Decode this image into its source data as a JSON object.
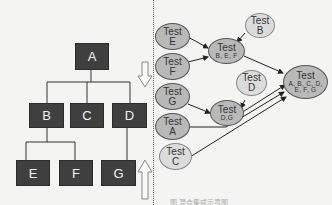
{
  "left_tree": {
    "root": "A",
    "level2": [
      "B",
      "C",
      "D"
    ],
    "level3": [
      "E",
      "F",
      "G"
    ],
    "arrows": {
      "top": "down-arrow",
      "bottom": "up-arrow"
    },
    "box_color": "#3f3f3f"
  },
  "right_graph": {
    "nodes": {
      "e": {
        "line1": "Test",
        "line2": "E"
      },
      "f": {
        "line1": "Test",
        "line2": "F"
      },
      "g": {
        "line1": "Test",
        "line2": "G"
      },
      "a": {
        "line1": "Test",
        "line2": "A"
      },
      "c": {
        "line1": "Test",
        "line2": "C"
      },
      "bef": {
        "line1": "Test",
        "line2": "B, E, F"
      },
      "b": {
        "line1": "Test",
        "line2": "B"
      },
      "d": {
        "line1": "Test",
        "line2": "D"
      },
      "dg": {
        "line1": "Test",
        "line2": "D,G"
      },
      "all": {
        "line1": "Test",
        "line2": "A, B, C, D,",
        "line3": "E, F, G"
      }
    },
    "edges": [
      [
        "Test E",
        "Test B,E,F"
      ],
      [
        "Test F",
        "Test B,E,F"
      ],
      [
        "Test B",
        "Test B,E,F"
      ],
      [
        "Test G",
        "Test D,G"
      ],
      [
        "Test D",
        "Test D,G"
      ],
      [
        "Test B,E,F",
        "Test A,B,C,D,E,F,G"
      ],
      [
        "Test D,G",
        "Test A,B,C,D,E,F,G"
      ],
      [
        "Test A",
        "Test A,B,C,D,E,F,G"
      ],
      [
        "Test C",
        "Test A,B,C,D,E,F,G"
      ]
    ],
    "colors": {
      "dark_node": "#b9b9b9",
      "light_node": "#dcdcdc"
    }
  },
  "caption": "图 混合集成示意图"
}
